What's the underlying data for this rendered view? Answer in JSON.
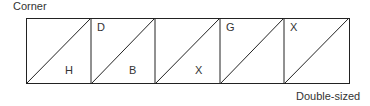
{
  "labels": {
    "corner": "Corner",
    "double_sized": "Double-sized"
  },
  "cells": [
    {
      "top_letter": "",
      "bottom_letter": "H"
    },
    {
      "top_letter": "D",
      "bottom_letter": "B"
    },
    {
      "top_letter": "",
      "bottom_letter": "X"
    },
    {
      "top_letter": "G",
      "bottom_letter": ""
    },
    {
      "top_letter": "X",
      "bottom_letter": ""
    }
  ],
  "colors": {
    "line": "#222222",
    "text": "#333333"
  }
}
